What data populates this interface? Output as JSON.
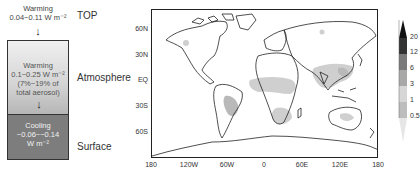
{
  "diagram": {
    "top": {
      "label": "TOP",
      "line1": "Warming",
      "line2": "0.04~0.11 W m⁻²"
    },
    "atmosphere": {
      "label": "Atmosphere",
      "line1": "Warming",
      "line2": "0.1~0.25 W m⁻²",
      "line3": "(7%~19% of",
      "line4": "total aerosol)"
    },
    "surface": {
      "label": "Surface",
      "line1": "Cooling",
      "line2": "−0.06~−0.14",
      "line3": "W m⁻²"
    },
    "arrow_glyph": "↓"
  },
  "map": {
    "y_ticks": [
      "60N",
      "30N",
      "EQ",
      "30S",
      "60S"
    ],
    "x_ticks": [
      "180",
      "120W",
      "60W",
      "0",
      "60E",
      "120E",
      "180"
    ],
    "colorbar": {
      "levels": [
        "20",
        "12",
        "6",
        "3",
        "1",
        "0.5"
      ],
      "colors": [
        "#111111",
        "#3a3a3a",
        "#7a7a7a",
        "#a8a8a8",
        "#d0d0d0",
        "#e8e8e8",
        "#bdbdbd"
      ]
    },
    "shade_colors": {
      "light": "#cfcfcf",
      "mid": "#b5b5b5"
    }
  }
}
